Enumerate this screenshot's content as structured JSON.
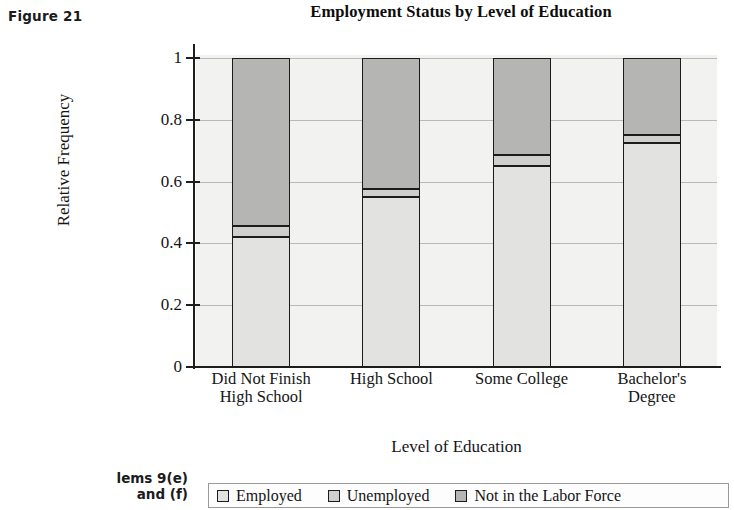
{
  "figure": {
    "label": "Figure 21",
    "margin_note_line1": "lems 9(e)",
    "margin_note_line2": "and (f)"
  },
  "chart_data": {
    "type": "bar",
    "subtype": "stacked-100-percent",
    "title": "Employment Status by Level of Education",
    "xlabel": "Level of Education",
    "ylabel": "Relative Frequency",
    "ylim": [
      0,
      1
    ],
    "yticks": [
      0,
      0.2,
      0.4,
      0.6,
      0.8,
      1
    ],
    "ytick_labels": [
      "0",
      "0.2",
      "0.4",
      "0.6",
      "0.8",
      "1"
    ],
    "grid": true,
    "legend_position": "bottom",
    "categories": [
      "Did Not Finish High School",
      "High School",
      "Some College",
      "Bachelor's Degree"
    ],
    "category_lines": [
      [
        "Did Not Finish",
        "High School"
      ],
      [
        "High School"
      ],
      [
        "Some College"
      ],
      [
        "Bachelor's",
        "Degree"
      ]
    ],
    "series": [
      {
        "name": "Employed",
        "color": "#e2e2e0",
        "values": [
          0.42,
          0.55,
          0.65,
          0.725
        ]
      },
      {
        "name": "Unemployed",
        "color": "#cfcfcd",
        "values": [
          0.035,
          0.025,
          0.035,
          0.025
        ]
      },
      {
        "name": "Not in the Labor Force",
        "color": "#b5b5b3",
        "values": [
          0.545,
          0.425,
          0.315,
          0.25
        ]
      }
    ],
    "plot_background": "#f2f2f0",
    "axis_color": "#1c1c1c",
    "grid_color": "#b9b9b9"
  }
}
